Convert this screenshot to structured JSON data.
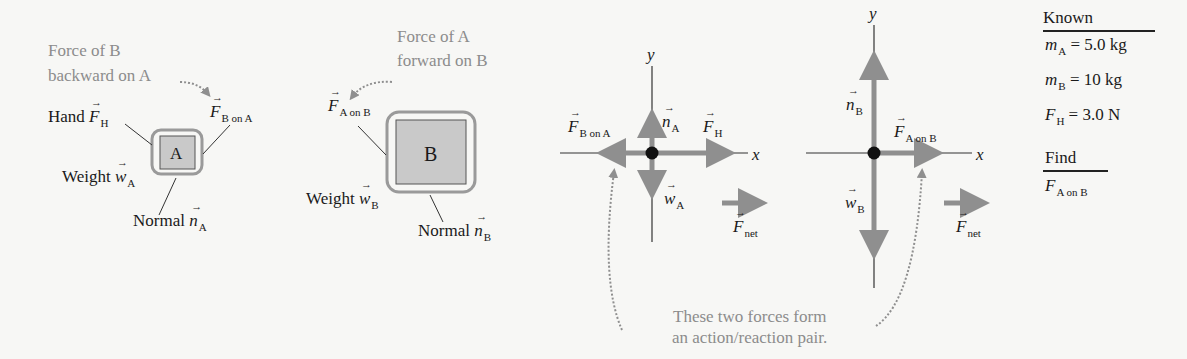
{
  "diagram": {
    "panel_a": {
      "annotation_line1": "Force of B",
      "annotation_line2": "backward on A",
      "block_label": "A",
      "hand_label": "Hand",
      "hand_symbol": "F",
      "hand_sub": "H",
      "fbona_symbol": "F",
      "fbona_sub": "B on A",
      "weight_label": "Weight",
      "weight_symbol": "w",
      "weight_sub": "A",
      "normal_label": "Normal",
      "normal_symbol": "n",
      "normal_sub": "A"
    },
    "panel_b": {
      "annotation_line1": "Force of A",
      "annotation_line2": "forward on B",
      "block_label": "B",
      "fona_symbol": "F",
      "fona_sub": "A on B",
      "weight_label": "Weight",
      "weight_symbol": "w",
      "weight_sub": "B",
      "normal_label": "Normal",
      "normal_symbol": "n",
      "normal_sub": "B"
    },
    "fbd_a": {
      "y_axis": "y",
      "x_axis": "x",
      "n_symbol": "n",
      "n_sub": "A",
      "fh_symbol": "F",
      "fh_sub": "H",
      "fbona_symbol": "F",
      "fbona_sub": "B on A",
      "w_symbol": "w",
      "w_sub": "A",
      "fnet_symbol": "F",
      "fnet_sub": "net"
    },
    "fbd_b": {
      "y_axis": "y",
      "x_axis": "x",
      "n_symbol": "n",
      "n_sub": "B",
      "faonb_symbol": "F",
      "faonb_sub": "A on B",
      "w_symbol": "w",
      "w_sub": "B",
      "fnet_symbol": "F",
      "fnet_sub": "net"
    },
    "pair_note_line1": "These two forces form",
    "pair_note_line2": "an action/reaction pair.",
    "known": {
      "heading": "Known",
      "rows": [
        {
          "sym": "m",
          "sub": "A",
          "val": "= 5.0 kg"
        },
        {
          "sym": "m",
          "sub": "B",
          "val": "= 10 kg"
        },
        {
          "sym": "F",
          "sub": "H",
          "val": "= 3.0 N"
        }
      ]
    },
    "find": {
      "heading": "Find",
      "sym": "F",
      "sub": "A on B"
    },
    "colors": {
      "arrow": "#8f8f8f",
      "block_fill": "#c9c9c9",
      "annotation_text": "#8c8c8c"
    }
  }
}
